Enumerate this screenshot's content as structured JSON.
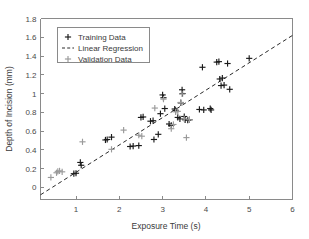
{
  "figure": {
    "background_color": "#ffffff",
    "axis_color": "#8a8a8a",
    "training_color": "#1a1a1a",
    "validation_color": "#9a9a9a",
    "regression_color": "#2a2a2a"
  },
  "chart_data": {
    "type": "scatter",
    "title": "",
    "xlabel": "Exposure Time (s)",
    "ylabel": "Depth of Incision (mm)",
    "xlim": [
      0.18,
      6.0
    ],
    "ylim": [
      -0.13,
      1.8
    ],
    "xticks": [
      1,
      2,
      3,
      4,
      5,
      6
    ],
    "xticklabels": [
      "1",
      "2",
      "3",
      "4",
      "5",
      "6"
    ],
    "yticks": [
      0,
      0.2,
      0.4,
      0.6,
      0.8,
      1,
      1.2,
      1.4,
      1.6,
      1.8
    ],
    "yticklabels": [
      "0",
      "0.2",
      "0.4",
      "0.6",
      "0.8",
      "1",
      "1.2",
      "1.4",
      "1.6",
      "1.8"
    ],
    "grid": false,
    "legend_position": "upper left",
    "series": [
      {
        "name": "Training Data",
        "marker": "plus",
        "color": "#1a1a1a",
        "points": [
          [
            0.95,
            0.145
          ],
          [
            1.0,
            0.15
          ],
          [
            1.1,
            0.265
          ],
          [
            1.12,
            0.235
          ],
          [
            1.68,
            0.505
          ],
          [
            1.72,
            0.51
          ],
          [
            1.82,
            0.535
          ],
          [
            2.25,
            0.435
          ],
          [
            2.32,
            0.44
          ],
          [
            2.45,
            0.445
          ],
          [
            2.5,
            0.745
          ],
          [
            2.55,
            0.75
          ],
          [
            2.72,
            0.705
          ],
          [
            2.78,
            0.71
          ],
          [
            2.8,
            0.51
          ],
          [
            2.9,
            0.565
          ],
          [
            2.95,
            0.785
          ],
          [
            3.0,
            0.985
          ],
          [
            3.02,
            0.955
          ],
          [
            3.05,
            0.84
          ],
          [
            3.15,
            0.675
          ],
          [
            3.2,
            0.66
          ],
          [
            3.28,
            0.835
          ],
          [
            3.3,
            0.82
          ],
          [
            3.35,
            0.745
          ],
          [
            3.4,
            0.73
          ],
          [
            3.42,
            0.9
          ],
          [
            3.45,
            1.04
          ],
          [
            3.46,
            1.0
          ],
          [
            3.5,
            0.755
          ],
          [
            3.52,
            0.72
          ],
          [
            3.58,
            0.715
          ],
          [
            3.62,
            0.72
          ],
          [
            3.85,
            0.83
          ],
          [
            3.92,
            1.28
          ],
          [
            3.95,
            0.825
          ],
          [
            4.1,
            0.84
          ],
          [
            4.12,
            0.825
          ],
          [
            4.25,
            1.335
          ],
          [
            4.3,
            1.34
          ],
          [
            4.32,
            1.155
          ],
          [
            4.35,
            1.085
          ],
          [
            4.38,
            1.165
          ],
          [
            4.42,
            1.09
          ],
          [
            4.5,
            1.32
          ],
          [
            4.55,
            1.045
          ],
          [
            5.0,
            1.375
          ]
        ]
      },
      {
        "name": "Validation Data",
        "marker": "plus",
        "color": "#9a9a9a",
        "points": [
          [
            0.42,
            0.105
          ],
          [
            0.55,
            0.155
          ],
          [
            0.58,
            0.17
          ],
          [
            0.62,
            0.175
          ],
          [
            0.68,
            0.165
          ],
          [
            1.15,
            0.485
          ],
          [
            1.82,
            0.405
          ],
          [
            2.1,
            0.61
          ],
          [
            2.45,
            0.555
          ],
          [
            2.52,
            0.545
          ],
          [
            2.82,
            0.845
          ],
          [
            3.02,
            0.94
          ],
          [
            3.2,
            0.625
          ],
          [
            3.25,
            0.67
          ],
          [
            3.3,
            0.805
          ],
          [
            3.35,
            0.81
          ],
          [
            3.42,
            0.905
          ],
          [
            3.45,
            0.995
          ],
          [
            3.5,
            0.73
          ],
          [
            3.55,
            0.53
          ],
          [
            3.62,
            0.72
          ]
        ]
      }
    ],
    "regression": {
      "name": "Linear Regression",
      "style": "dashed",
      "color": "#2a2a2a",
      "x_start": 0.18,
      "y_start": -0.08,
      "x_end": 6.0,
      "y_end": 1.62,
      "slope": 0.2921,
      "intercept": -0.1326
    }
  },
  "legend": {
    "entries": [
      {
        "label": "Training Data",
        "symbol": "plus",
        "color": "#1a1a1a"
      },
      {
        "label": "Linear Regression",
        "symbol": "dashed-line",
        "color": "#2a2a2a"
      },
      {
        "label": "Validation Data",
        "symbol": "plus",
        "color": "#9a9a9a"
      }
    ]
  }
}
